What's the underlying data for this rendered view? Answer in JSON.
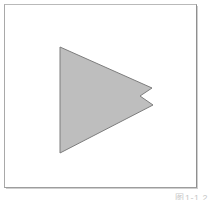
{
  "figure": {
    "caption": "图1-1.2",
    "background_color": "#ffffff",
    "frame": {
      "border_color": "#9d9d9d",
      "fill_color": "#ffffff"
    },
    "shape": {
      "name": "notched-right-arrow",
      "description": "Right-pointing solid triangle with a V notch cut into its right tip",
      "fill_color": "#bebebe",
      "stroke_color": "#7d7d7d",
      "stroke_width": 1,
      "points": "56,43 148,84 136,92 149,101 56,149",
      "vertices": [
        {
          "label": "top-left",
          "x": 56,
          "y": 43
        },
        {
          "label": "upper-tip",
          "x": 148,
          "y": 84
        },
        {
          "label": "notch-inner",
          "x": 136,
          "y": 92
        },
        {
          "label": "lower-tip",
          "x": 149,
          "y": 101
        },
        {
          "label": "bottom-left",
          "x": 56,
          "y": 149
        }
      ]
    }
  }
}
